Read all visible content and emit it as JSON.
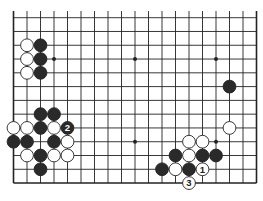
{
  "diagram": {
    "type": "go-board-fragment",
    "columns": 19,
    "rows_visible": 13,
    "open_top": true,
    "star_points": [
      [
        3,
        3
      ],
      [
        9,
        3
      ],
      [
        15,
        3
      ],
      [
        3,
        9
      ],
      [
        9,
        9
      ],
      [
        15,
        9
      ]
    ],
    "stones": [
      {
        "c": 1,
        "r": 2,
        "color": "white"
      },
      {
        "c": 1,
        "r": 3,
        "color": "white"
      },
      {
        "c": 1,
        "r": 4,
        "color": "white"
      },
      {
        "c": 2,
        "r": 2,
        "color": "black"
      },
      {
        "c": 2,
        "r": 3,
        "color": "black"
      },
      {
        "c": 2,
        "r": 4,
        "color": "black"
      },
      {
        "c": 16,
        "r": 5,
        "color": "black"
      },
      {
        "c": 2,
        "r": 7,
        "color": "black"
      },
      {
        "c": 3,
        "r": 7,
        "color": "black"
      },
      {
        "c": 0,
        "r": 8,
        "color": "white"
      },
      {
        "c": 1,
        "r": 8,
        "color": "white"
      },
      {
        "c": 2,
        "r": 8,
        "color": "black"
      },
      {
        "c": 3,
        "r": 8,
        "color": "white"
      },
      {
        "c": 4,
        "r": 8,
        "color": "black",
        "label": "2"
      },
      {
        "c": 0,
        "r": 9,
        "color": "black"
      },
      {
        "c": 1,
        "r": 9,
        "color": "black"
      },
      {
        "c": 3,
        "r": 9,
        "color": "black"
      },
      {
        "c": 4,
        "r": 9,
        "color": "white"
      },
      {
        "c": 1,
        "r": 10,
        "color": "white"
      },
      {
        "c": 2,
        "r": 10,
        "color": "black"
      },
      {
        "c": 3,
        "r": 10,
        "color": "white"
      },
      {
        "c": 4,
        "r": 10,
        "color": "white"
      },
      {
        "c": 2,
        "r": 11,
        "color": "black"
      },
      {
        "c": 16,
        "r": 8,
        "color": "white"
      },
      {
        "c": 13,
        "r": 9,
        "color": "white"
      },
      {
        "c": 14,
        "r": 9,
        "color": "white"
      },
      {
        "c": 12,
        "r": 10,
        "color": "black"
      },
      {
        "c": 13,
        "r": 10,
        "color": "white"
      },
      {
        "c": 14,
        "r": 10,
        "color": "black"
      },
      {
        "c": 15,
        "r": 10,
        "color": "black"
      },
      {
        "c": 11,
        "r": 11,
        "color": "black"
      },
      {
        "c": 12,
        "r": 11,
        "color": "white"
      },
      {
        "c": 13,
        "r": 11,
        "color": "black"
      },
      {
        "c": 14,
        "r": 11,
        "color": "white",
        "label": "1"
      },
      {
        "c": 13,
        "r": 12,
        "color": "white",
        "label": "3"
      }
    ],
    "colors": {
      "line": "#222222",
      "black": "#2a2a2a",
      "white": "#ffffff",
      "label_on_black": "#ffffff",
      "label_on_white": "#222222"
    }
  }
}
